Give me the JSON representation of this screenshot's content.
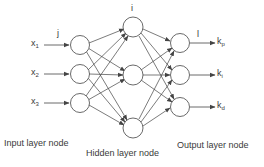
{
  "diagram": {
    "type": "neural-network",
    "colors": {
      "stroke": "#444444",
      "node_fill": "#ffffff",
      "text": "#3a3a3a"
    },
    "layer_index_labels": {
      "input": "j",
      "hidden": "i",
      "output": "l"
    },
    "inputs": [
      {
        "base": "x",
        "sub": "1"
      },
      {
        "base": "x",
        "sub": "2"
      },
      {
        "base": "x",
        "sub": "3"
      }
    ],
    "outputs": [
      {
        "base": "k",
        "sub": "p"
      },
      {
        "base": "k",
        "sub": "i"
      },
      {
        "base": "k",
        "sub": "d"
      }
    ],
    "layer_labels": {
      "input": "Input layer node",
      "hidden": "Hidden layer node",
      "output": "Output layer node"
    },
    "layers": {
      "input_nodes": 3,
      "hidden_nodes": 3,
      "output_nodes": 3
    }
  }
}
